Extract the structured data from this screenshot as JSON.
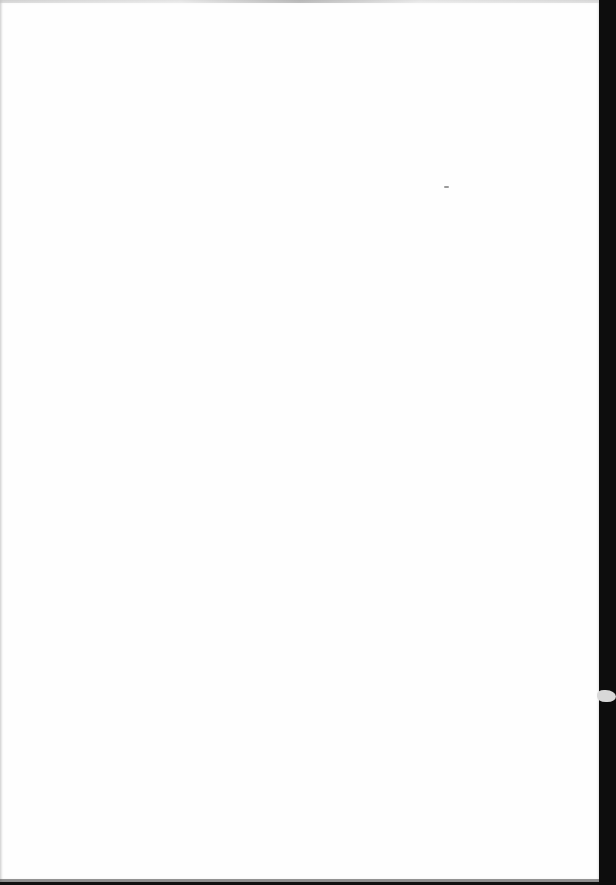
{
  "document": {
    "page_content": "",
    "colors": {
      "paper": "#fefefe",
      "scanner_background": "#111111",
      "speck": "#9a9a9a"
    }
  }
}
